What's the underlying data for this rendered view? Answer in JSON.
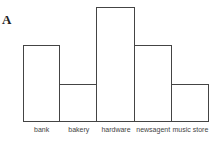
{
  "panel_label": "A",
  "chart_data": {
    "type": "bar",
    "title": "",
    "xlabel": "",
    "ylabel": "",
    "categories": [
      "bank",
      "bakery",
      "hardware",
      "newsagent",
      "music store"
    ],
    "values": [
      2,
      1,
      3,
      2,
      1
    ],
    "ylim": [
      0,
      3
    ],
    "grid": false,
    "legend": null,
    "bar_fill": "#ffffff",
    "bar_edge": "#444444"
  }
}
